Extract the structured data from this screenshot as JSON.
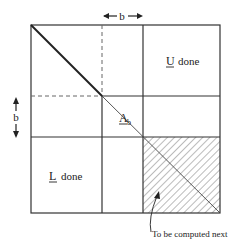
{
  "diagram": {
    "type": "blocked-lu-factorization",
    "labels": {
      "block_width": "b",
      "block_height": "b",
      "u_symbol": "U",
      "u_text": "done",
      "l_symbol": "L",
      "l_text": "done",
      "a_symbol": "A",
      "a_subscript": "b",
      "next_annotation": "To be computed next"
    },
    "colors": {
      "line": "#333333",
      "hatch": "#555555",
      "text": "#222222"
    }
  }
}
